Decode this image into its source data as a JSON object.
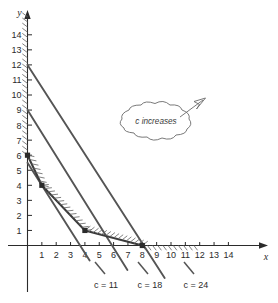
{
  "figure": {
    "kind": "linear-programming-graph",
    "axis_x_label": "x",
    "axis_y_label": "y",
    "callout_text": "c increases"
  },
  "chart_data": {
    "type": "line",
    "title": "",
    "xlabel": "x",
    "ylabel": "y",
    "xlim": [
      0,
      15
    ],
    "ylim": [
      0,
      15.5
    ],
    "grid": false,
    "legend": "none",
    "x_ticks": [
      1,
      2,
      3,
      4,
      5,
      6,
      7,
      8,
      9,
      10,
      11,
      12,
      13,
      14
    ],
    "y_ticks": [
      1,
      2,
      3,
      4,
      5,
      6,
      7,
      8,
      9,
      10,
      11,
      12,
      13,
      14
    ],
    "annotations": [
      {
        "text": "c increases",
        "type": "cloud-callout",
        "x": 6.5,
        "y": 9.3
      },
      {
        "text": "c = 11",
        "type": "line-label",
        "x": 3.7,
        "y": -2.4
      },
      {
        "text": "c = 18",
        "type": "line-label",
        "x": 5.9,
        "y": -2.4
      },
      {
        "text": "c = 24",
        "type": "line-label",
        "x": 8.1,
        "y": -2.4
      }
    ],
    "vertices": [
      {
        "x": 0,
        "y": 6,
        "marker": "filled-square"
      },
      {
        "x": 1,
        "y": 4,
        "marker": "filled-square"
      },
      {
        "x": 4,
        "y": 1,
        "marker": "filled-square"
      },
      {
        "x": 8,
        "y": 0,
        "marker": "filled-square"
      }
    ],
    "series": [
      {
        "name": "c = 11",
        "label": "c = 11",
        "type": "objective-line",
        "points": [
          [
            0,
            5.5
          ],
          [
            3.67,
            0
          ]
        ],
        "color": "#555555"
      },
      {
        "name": "c = 18",
        "label": "c = 18",
        "type": "objective-line",
        "points": [
          [
            0,
            9.0
          ],
          [
            5.9,
            0
          ]
        ],
        "color": "#555555"
      },
      {
        "name": "c = 24",
        "label": "c = 24",
        "type": "objective-line",
        "points": [
          [
            0,
            12.0
          ],
          [
            8.1,
            0
          ]
        ],
        "color": "#555555"
      },
      {
        "name": "constraint-1",
        "label": "",
        "type": "constraint-boundary",
        "points": [
          [
            0,
            6
          ],
          [
            1,
            4
          ]
        ],
        "color": "#3a3a3a"
      },
      {
        "name": "constraint-2",
        "label": "",
        "type": "constraint-boundary",
        "points": [
          [
            1,
            4
          ],
          [
            4,
            1
          ]
        ],
        "color": "#3a3a3a"
      },
      {
        "name": "constraint-3",
        "label": "",
        "type": "constraint-boundary",
        "points": [
          [
            4,
            1
          ],
          [
            8,
            0
          ]
        ],
        "color": "#3a3a3a"
      }
    ],
    "hatching": {
      "description": "feasible-region boundary hatching on infeasible side",
      "edges": [
        "y-axis above y=6",
        "x-axis right of x=8",
        "constraint boundary chain"
      ]
    }
  },
  "labels": {
    "x_ticks": [
      "1",
      "2",
      "3",
      "4",
      "5",
      "6",
      "7",
      "8",
      "9",
      "10",
      "11",
      "12",
      "13",
      "14"
    ],
    "y_ticks": [
      "1",
      "2",
      "3",
      "4",
      "5",
      "6",
      "7",
      "8",
      "9",
      "10",
      "11",
      "12",
      "13",
      "14"
    ],
    "c11": "c = 11",
    "c18": "c = 18",
    "c24": "c = 24"
  },
  "colors": {
    "ink": "#2b2b2b",
    "line": "#555555",
    "hatch": "#6a6a6a",
    "background": "#ffffff"
  }
}
